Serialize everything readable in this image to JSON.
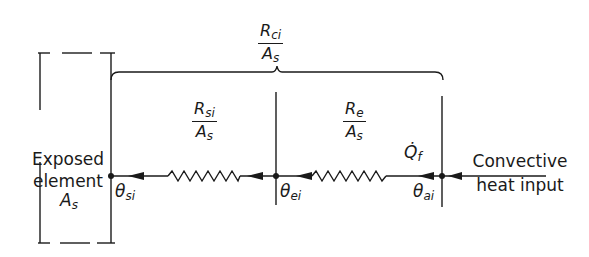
{
  "diagram": {
    "type": "thermal-resistance-network",
    "element": {
      "label_line1": "Exposed",
      "label_line2": "element",
      "area_symbol": "A",
      "area_sub": "s"
    },
    "overall_resistance": {
      "numerator": "R",
      "numerator_sub": "ci",
      "denominator": "A",
      "denominator_sub": "s"
    },
    "resistors": [
      {
        "numerator": "R",
        "numerator_sub": "si",
        "denominator": "A",
        "denominator_sub": "s"
      },
      {
        "numerator": "R",
        "numerator_sub": "e",
        "denominator": "A",
        "denominator_sub": "s"
      }
    ],
    "heat_flow": {
      "symbol": "Q̇",
      "sub": "f"
    },
    "nodes": [
      {
        "symbol": "θ",
        "sub": "si"
      },
      {
        "symbol": "θ",
        "sub": "ei"
      },
      {
        "symbol": "θ",
        "sub": "ai"
      }
    ],
    "input": {
      "line1": "Convective",
      "line2": "heat input"
    },
    "colors": {
      "ink": "#1a1a1a",
      "background": "#ffffff"
    }
  }
}
